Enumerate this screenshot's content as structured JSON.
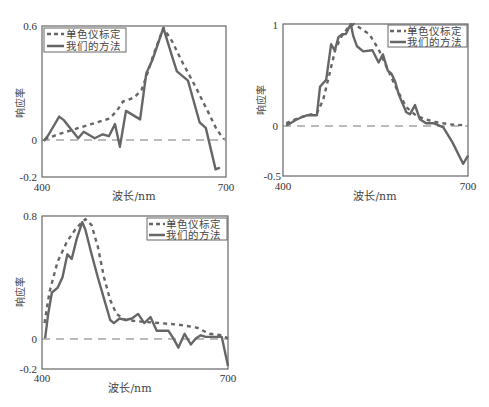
{
  "legend": {
    "dashed_label": "单色仪标定",
    "solid_label": "我们的方法"
  },
  "colors": {
    "series": "#666666",
    "axis": "#666666",
    "zero_line": "#777777"
  },
  "chart_data": [
    {
      "type": "line",
      "title": "",
      "xlabel": "波长/nm",
      "ylabel": "响应率",
      "xlim": [
        400,
        700
      ],
      "ylim": [
        -0.2,
        0.6
      ],
      "xticks": [
        "400",
        "700"
      ],
      "yticks": [
        "0.6",
        "0",
        "-0.2"
      ],
      "zero_line": true,
      "legend_position": "upper left",
      "series": [
        {
          "name": "单色仪标定",
          "style": "dashed",
          "x": [
            404,
            430,
            460,
            490,
            510,
            522,
            532,
            550,
            562,
            572,
            582,
            598,
            612,
            630,
            650,
            670,
            685,
            697
          ],
          "values": [
            0.0,
            0.03,
            0.06,
            0.09,
            0.11,
            0.15,
            0.2,
            0.22,
            0.26,
            0.35,
            0.45,
            0.59,
            0.52,
            0.4,
            0.28,
            0.15,
            0.05,
            0.0
          ]
        },
        {
          "name": "我们的方法",
          "style": "solid",
          "x": [
            403,
            410,
            428,
            436,
            459,
            468,
            486,
            499,
            509,
            519,
            527,
            537,
            560,
            570,
            580,
            598,
            612,
            620,
            638,
            657,
            667,
            683,
            690
          ],
          "values": [
            -0.01,
            0.02,
            0.12,
            0.1,
            0.005,
            0.04,
            0.005,
            0.026,
            0.016,
            0.08,
            -0.04,
            0.15,
            0.105,
            0.35,
            0.42,
            0.59,
            0.44,
            0.36,
            0.31,
            0.09,
            0.06,
            -0.16,
            -0.15
          ]
        }
      ]
    },
    {
      "type": "line",
      "title": "",
      "xlabel": "波长/nm",
      "ylabel": "响应率",
      "xlim": [
        400,
        700
      ],
      "ylim": [
        -0.5,
        1.0
      ],
      "xticks": [
        "400",
        "700"
      ],
      "yticks": [
        "1",
        "0",
        "-0.5"
      ],
      "zero_line": true,
      "legend_position": "upper right",
      "series": [
        {
          "name": "单色仪标定",
          "style": "dashed",
          "x": [
            405,
            420,
            440,
            455,
            465,
            475,
            485,
            495,
            505,
            515,
            525,
            540,
            555,
            570,
            585,
            600,
            615,
            630,
            650,
            670,
            695
          ],
          "values": [
            0.02,
            0.06,
            0.1,
            0.12,
            0.25,
            0.5,
            0.75,
            0.88,
            0.96,
            1.0,
            0.96,
            0.9,
            0.75,
            0.55,
            0.35,
            0.18,
            0.1,
            0.06,
            0.03,
            0.01,
            0.0
          ]
        },
        {
          "name": "我们的方法",
          "style": "solid",
          "x": [
            405,
            412,
            420,
            430,
            440,
            455,
            460,
            470,
            478,
            484,
            490,
            496,
            502,
            510,
            514,
            520,
            530,
            545,
            555,
            562,
            570,
            576,
            582,
            588,
            600,
            606,
            614,
            622,
            632,
            645,
            660,
            675,
            692,
            700
          ],
          "values": [
            0.0,
            0.02,
            0.05,
            0.08,
            0.1,
            0.1,
            0.38,
            0.45,
            0.8,
            0.74,
            0.87,
            0.9,
            0.9,
            1.0,
            0.88,
            0.78,
            0.73,
            0.74,
            0.62,
            0.7,
            0.54,
            0.51,
            0.43,
            0.3,
            0.13,
            0.11,
            0.2,
            0.06,
            0.02,
            0.02,
            -0.02,
            -0.17,
            -0.38,
            -0.3
          ]
        }
      ]
    },
    {
      "type": "line",
      "title": "",
      "xlabel": "波长/nm",
      "ylabel": "响应率",
      "xlim": [
        400,
        700
      ],
      "ylim": [
        -0.2,
        0.8
      ],
      "xticks": [
        "400",
        "700"
      ],
      "yticks": [
        "0.8",
        "0",
        "-0.2"
      ],
      "zero_line": true,
      "legend_position": "upper right",
      "series": [
        {
          "name": "单色仪标定",
          "style": "dashed",
          "x": [
            404,
            412,
            425,
            440,
            455,
            470,
            480,
            490,
            500,
            510,
            520,
            535,
            560,
            590,
            620,
            650,
            670,
            690,
            700
          ],
          "values": [
            0.1,
            0.3,
            0.5,
            0.63,
            0.72,
            0.78,
            0.74,
            0.6,
            0.4,
            0.25,
            0.16,
            0.12,
            0.11,
            0.1,
            0.09,
            0.07,
            0.03,
            0.02,
            0.0
          ]
        },
        {
          "name": "我们的方法",
          "style": "solid",
          "x": [
            405,
            410,
            416,
            425,
            433,
            441,
            448,
            456,
            465,
            470,
            480,
            490,
            500,
            510,
            516,
            525,
            535,
            545,
            555,
            565,
            575,
            585,
            598,
            604,
            612,
            620,
            630,
            640,
            648,
            656,
            664,
            676,
            690,
            700
          ],
          "values": [
            0.0,
            0.16,
            0.3,
            0.33,
            0.4,
            0.55,
            0.52,
            0.65,
            0.76,
            0.71,
            0.55,
            0.4,
            0.26,
            0.12,
            0.1,
            0.13,
            0.12,
            0.13,
            0.16,
            0.1,
            0.14,
            0.05,
            0.05,
            0.05,
            0.0,
            -0.06,
            0.03,
            -0.04,
            0.0,
            0.02,
            0.01,
            0.01,
            0.01,
            -0.18
          ]
        }
      ]
    }
  ]
}
